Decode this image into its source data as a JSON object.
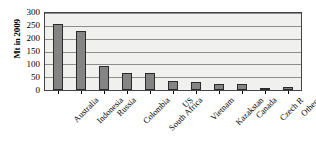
{
  "chart_data": {
    "type": "bar",
    "title": "",
    "xlabel": "",
    "ylabel": "Mt in 2009",
    "ylim": [
      0,
      300
    ],
    "yticks": [
      0,
      50,
      100,
      150,
      200,
      250,
      300
    ],
    "grid": true,
    "legend": "none",
    "categories": [
      "Australia",
      "Indonesia",
      "Russia",
      "Colombia",
      "South Africa",
      "US",
      "Vietnam",
      "Kazakstan",
      "Canada",
      "Czech R",
      "Others"
    ],
    "values": [
      258,
      230,
      92,
      68,
      67,
      35,
      30,
      25,
      22,
      6,
      12
    ],
    "series": [
      {
        "name": "Mt in 2009",
        "values": [
          258,
          230,
          92,
          68,
          67,
          35,
          30,
          25,
          22,
          6,
          12
        ]
      }
    ],
    "bar_color": "#848484",
    "bar_border_color": "#2a2a2a",
    "plot_background": "#f0f0ee",
    "gridline_color": "#8d8d8d",
    "axis_color": "#444444"
  },
  "axes": {
    "y_title": "Mt in 2009",
    "y_tick_labels": [
      "300",
      "250",
      "200",
      "150",
      "100",
      "50",
      "0"
    ]
  }
}
